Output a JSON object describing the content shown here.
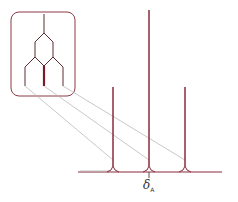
{
  "diagram": {
    "type": "nmr-splitting-tree",
    "label_symbol": "δ",
    "label_subscript": "A",
    "colors": {
      "peaks": "#8a2a3a",
      "baseline": "#8a2a3a",
      "guide_lines": "#b0b0b0",
      "box": "#8a3a44"
    },
    "peaks": [
      {
        "name": "left",
        "x": 113,
        "top": 87,
        "relative_height": 1
      },
      {
        "name": "center",
        "x": 149,
        "top": 10,
        "relative_height": 2
      },
      {
        "name": "right",
        "x": 185,
        "top": 87,
        "relative_height": 1
      }
    ]
  }
}
